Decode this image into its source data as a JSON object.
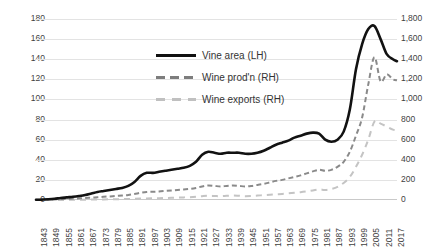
{
  "chart_data": {
    "type": "line",
    "title": "",
    "xlabel": "",
    "ylabel": "",
    "grid": true,
    "legend_position": "upper-center",
    "axes": {
      "left": {
        "label": "",
        "ylim": [
          0,
          180
        ],
        "ticks": [
          "0",
          "20",
          "40",
          "60",
          "80",
          "100",
          "120",
          "140",
          "160",
          "180"
        ],
        "tick_values": [
          0,
          20,
          40,
          60,
          80,
          100,
          120,
          140,
          160,
          180
        ]
      },
      "right": {
        "label": "",
        "ylim": [
          0,
          1800
        ],
        "ticks": [
          "0",
          "200",
          "400",
          "600",
          "800",
          "1,000",
          "1,200",
          "1,400",
          "1,600",
          "1,800"
        ],
        "tick_values": [
          0,
          200,
          400,
          600,
          800,
          1000,
          1200,
          1400,
          1600,
          1800
        ]
      }
    },
    "xlim": [
      1843,
      2019
    ],
    "xtick_labels": [
      "1843",
      "1849",
      "1855",
      "1861",
      "1867",
      "1873",
      "1879",
      "1885",
      "1891",
      "1897",
      "1903",
      "1909",
      "1915",
      "1921",
      "1927",
      "1933",
      "1939",
      "1945",
      "1951",
      "1957",
      "1963",
      "1969",
      "1975",
      "1981",
      "1987",
      "1993",
      "1999",
      "2005",
      "2011",
      "2017"
    ],
    "legend": [
      {
        "name": "Vine area (LH)",
        "axis": "left",
        "style": "solid",
        "color": "#121212"
      },
      {
        "name": "Wine prod'n (RH)",
        "axis": "right",
        "style": "dashed",
        "color": "#8a8a8a"
      },
      {
        "name": "Wine exports (RH)",
        "axis": "right",
        "style": "dashed-light",
        "color": "#c4c4c4"
      }
    ],
    "series": [
      {
        "name": "Vine area (LH)",
        "axis": "left",
        "x": [
          1843,
          1846,
          1849,
          1852,
          1855,
          1858,
          1861,
          1864,
          1867,
          1870,
          1873,
          1876,
          1879,
          1882,
          1885,
          1888,
          1891,
          1894,
          1897,
          1900,
          1903,
          1906,
          1909,
          1912,
          1915,
          1918,
          1921,
          1924,
          1927,
          1930,
          1933,
          1936,
          1939,
          1942,
          1945,
          1948,
          1951,
          1954,
          1957,
          1960,
          1963,
          1966,
          1969,
          1972,
          1975,
          1978,
          1981,
          1984,
          1987,
          1990,
          1993,
          1996,
          1999,
          2002,
          2005,
          2008,
          2011,
          2014,
          2017,
          2019
        ],
        "values": [
          0.2,
          0.4,
          0.7,
          1.2,
          2,
          2.6,
          3.2,
          4,
          5,
          6.5,
          8,
          9,
          10,
          11,
          12,
          14,
          18,
          24,
          27,
          27,
          28,
          29,
          30,
          31,
          32,
          34,
          38,
          45,
          48,
          47,
          46,
          47,
          47,
          47,
          46,
          46,
          47,
          49,
          52,
          55,
          57,
          59,
          62,
          64,
          66,
          67,
          66,
          60,
          58,
          60,
          68,
          90,
          130,
          155,
          170,
          173,
          160,
          145,
          140,
          138
        ]
      },
      {
        "name": "Wine prod'n (RH)",
        "axis": "right",
        "x": [
          1843,
          1846,
          1849,
          1852,
          1855,
          1858,
          1861,
          1864,
          1867,
          1870,
          1873,
          1876,
          1879,
          1882,
          1885,
          1888,
          1891,
          1894,
          1897,
          1900,
          1903,
          1906,
          1909,
          1912,
          1915,
          1918,
          1921,
          1924,
          1927,
          1930,
          1933,
          1936,
          1939,
          1942,
          1945,
          1948,
          1951,
          1954,
          1957,
          1960,
          1963,
          1966,
          1969,
          1972,
          1975,
          1978,
          1981,
          1984,
          1987,
          1990,
          1993,
          1996,
          1999,
          2002,
          2005,
          2008,
          2011,
          2014,
          2017,
          2019
        ],
        "values": [
          2,
          3,
          4,
          6,
          9,
          11,
          14,
          17,
          20,
          24,
          28,
          32,
          36,
          40,
          44,
          50,
          60,
          72,
          80,
          82,
          85,
          90,
          95,
          100,
          105,
          110,
          120,
          135,
          145,
          140,
          135,
          140,
          145,
          140,
          135,
          140,
          150,
          160,
          175,
          190,
          200,
          215,
          230,
          245,
          265,
          285,
          300,
          290,
          300,
          330,
          380,
          480,
          640,
          820,
          1150,
          1420,
          1180,
          1250,
          1200,
          1190
        ]
      },
      {
        "name": "Wine exports (RH)",
        "axis": "right",
        "x": [
          1843,
          1846,
          1849,
          1852,
          1855,
          1858,
          1861,
          1864,
          1867,
          1870,
          1873,
          1876,
          1879,
          1882,
          1885,
          1888,
          1891,
          1894,
          1897,
          1900,
          1903,
          1906,
          1909,
          1912,
          1915,
          1918,
          1921,
          1924,
          1927,
          1930,
          1933,
          1936,
          1939,
          1942,
          1945,
          1948,
          1951,
          1954,
          1957,
          1960,
          1963,
          1966,
          1969,
          1972,
          1975,
          1978,
          1981,
          1984,
          1987,
          1990,
          1993,
          1996,
          1999,
          2002,
          2005,
          2008,
          2011,
          2014,
          2017,
          2019
        ],
        "values": [
          0,
          0,
          0,
          0,
          1,
          1,
          2,
          2,
          3,
          4,
          5,
          6,
          7,
          8,
          9,
          10,
          12,
          14,
          16,
          17,
          18,
          20,
          22,
          24,
          26,
          28,
          32,
          38,
          42,
          40,
          38,
          42,
          45,
          42,
          38,
          40,
          44,
          48,
          52,
          56,
          60,
          66,
          72,
          78,
          86,
          95,
          105,
          100,
          110,
          130,
          170,
          230,
          330,
          450,
          600,
          780,
          760,
          730,
          700,
          690
        ]
      }
    ]
  },
  "yticks_left": [
    "180",
    "160",
    "140",
    "120",
    "100",
    "80",
    "60",
    "40",
    "20",
    "0"
  ],
  "yticks_right": [
    "1,800",
    "1,600",
    "1,400",
    "1,200",
    "1,000",
    "800",
    "600",
    "400",
    "200",
    "0"
  ]
}
